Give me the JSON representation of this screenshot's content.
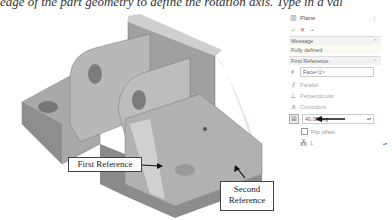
{
  "caption": "edge of the part geometry to define the rotation axis. Type in a val",
  "viewport": {
    "callouts": {
      "first_reference": "First Reference",
      "second_reference_line1": "Second",
      "second_reference_line2": "Reference"
    },
    "colors": {
      "part_face": "#b5b5b5",
      "part_dark": "#8e8e8e",
      "part_light": "#d4d4d4",
      "preview_plane": "#e8d9c8"
    }
  },
  "property_manager": {
    "title": "Plane",
    "actions": {
      "ok": "✓",
      "cancel": "✕",
      "pin": "⊸"
    },
    "message_section": {
      "label": "Message",
      "text": "Fully defined"
    },
    "first_reference_section": {
      "label": "First Reference",
      "selection": "Face<1>",
      "options": [
        {
          "label": "Parallel",
          "icon": "parallel-icon"
        },
        {
          "label": "Perpendicular",
          "icon": "perpendicular-icon"
        },
        {
          "label": "Coincident",
          "icon": "coincident-icon"
        }
      ],
      "angle_value": "40.00deg",
      "flip_offset_label": "Flip offset",
      "instances_value": "1"
    }
  }
}
